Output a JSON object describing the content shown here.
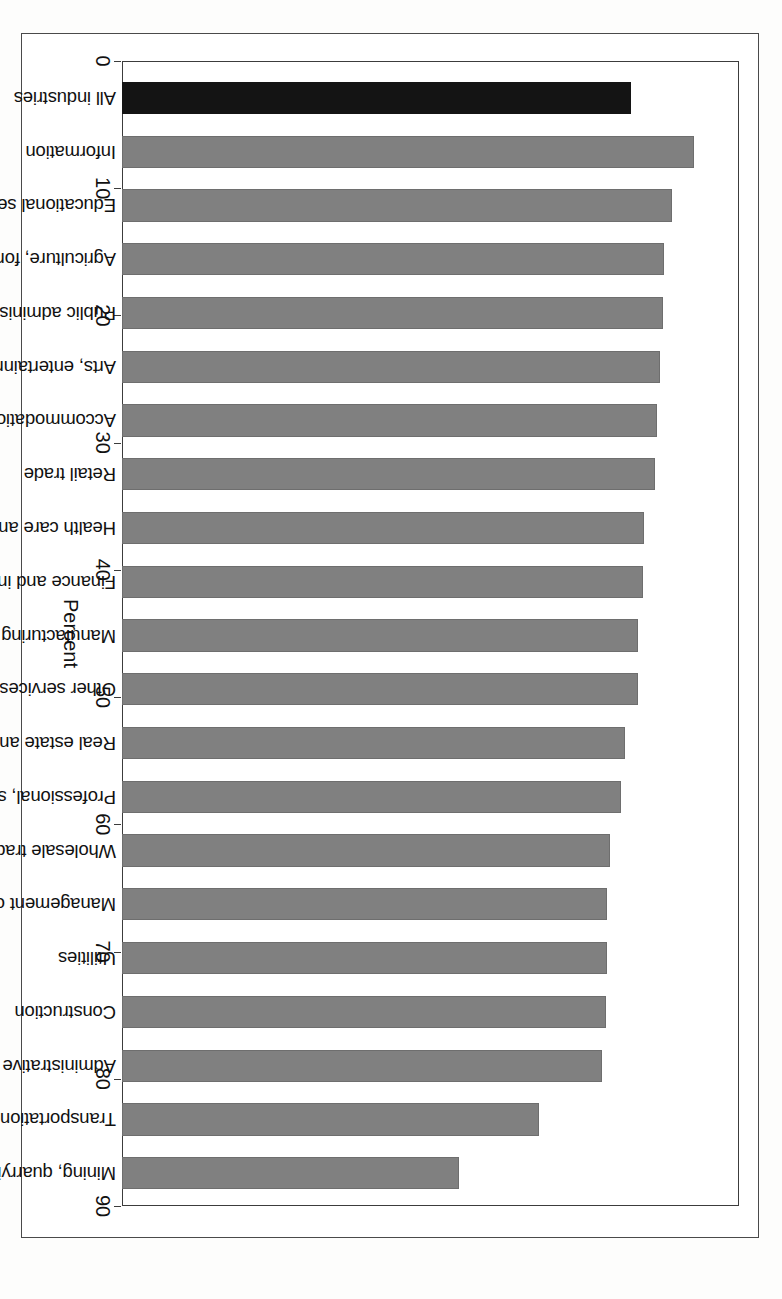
{
  "chart_data": {
    "type": "bar",
    "title": "",
    "subtitle": "",
    "xlabel": "",
    "ylabel": "Percent",
    "ylim": [
      0,
      90
    ],
    "ytick_step": 10,
    "yticks": [
      0,
      10,
      20,
      30,
      40,
      50,
      60,
      70,
      80,
      90
    ],
    "grid": false,
    "legend": null,
    "orientation": "vertical-bars-on-rotated-page",
    "highlight_category": "All industries",
    "colors": {
      "highlight_bar": "#141414",
      "bar": "#808080",
      "frame": "#3c3c3c",
      "text": "#111111",
      "background": "#ffffff"
    },
    "categories": [
      "All industries",
      "Information",
      "Educational services",
      "Agriculture, forestry, fishing and hunting",
      "Public administration",
      "Arts, entertainment, and recreation",
      "Accommodation and food services",
      "Retail trade",
      "Health care and social assistance",
      "Finance and insurance",
      "Manufacturing",
      "Other services (except public administration)",
      "Real estate and rental and leasing",
      "Professional, scientific, and technical services",
      "Wholesale trade",
      "Management of companies and enterprises",
      "Utilities",
      "Construction",
      "Administrative and waste services",
      "Transportation and warehousing",
      "Mining, quarrying, and oil and gas extraction"
    ],
    "values": [
      74.2,
      83.5,
      80.3,
      79.0,
      78.9,
      78.5,
      78.0,
      77.7,
      76.2,
      76.0,
      75.3,
      75.2,
      73.4,
      72.8,
      71.2,
      70.8,
      70.8,
      70.6,
      70.0,
      60.8,
      49.2
    ]
  },
  "axis": {
    "unit_label": "Percent",
    "tick_labels": [
      "0",
      "10",
      "20",
      "30",
      "40",
      "50",
      "60",
      "70",
      "80",
      "90"
    ]
  }
}
